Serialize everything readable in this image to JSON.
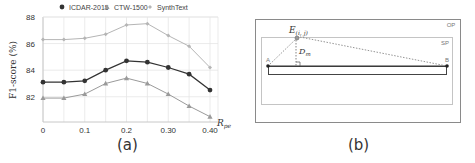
{
  "panel_a": {
    "caption": "(a)"
  },
  "panel_b": {
    "caption": "(b)",
    "labels": {
      "outer_box": "OP",
      "inner_box": "SP",
      "point_e": "E",
      "point_e_sub": "(i, j)",
      "distance": "D",
      "distance_sub": "m",
      "point_a": "A",
      "point_b": "B"
    },
    "description": "Geometric diagram: outer region OP containing sub-region SP; a point E(i,j) connected by dashed lines to endpoints A and B of a horizontal bar, with a perpendicular dashed segment D_m from E to segment AB marked with a right-angle symbol."
  },
  "colors": {
    "icdar": "#333333",
    "ctw": "#9a9a9a",
    "synth": "#b5b5b5",
    "grid": "#e6e6e6",
    "axis": "#c8c8c8"
  },
  "chart_data": {
    "type": "line",
    "title": "",
    "xlabel": "R_pe",
    "ylabel": "F1-score (%)",
    "x": [
      0,
      0.05,
      0.1,
      0.15,
      0.2,
      0.25,
      0.3,
      0.35,
      0.4
    ],
    "x_tick_labels": [
      "0",
      "0.1",
      "0.2",
      "0.30",
      "0.40"
    ],
    "x_tick_values": [
      0,
      0.1,
      0.2,
      0.3,
      0.4
    ],
    "y_tick_labels": [
      "82",
      "84",
      "86",
      "88"
    ],
    "y_tick_values": [
      82,
      84,
      86,
      88
    ],
    "ylim": [
      80.1,
      88
    ],
    "xlim": [
      0,
      0.4
    ],
    "grid": true,
    "legend_position": "top",
    "series": [
      {
        "name": "ICDAR-2015",
        "marker": "circle",
        "values": [
          83.1,
          83.1,
          83.2,
          84.0,
          84.7,
          84.6,
          84.2,
          83.7,
          82.5
        ]
      },
      {
        "name": "CTW-1500",
        "marker": "triangle",
        "values": [
          81.9,
          81.9,
          82.2,
          83.0,
          83.4,
          83.0,
          82.2,
          81.3,
          80.5
        ]
      },
      {
        "name": "SynthText",
        "marker": "diamond",
        "values": [
          86.3,
          86.3,
          86.4,
          86.7,
          87.4,
          87.5,
          86.6,
          85.8,
          84.2
        ]
      }
    ]
  }
}
